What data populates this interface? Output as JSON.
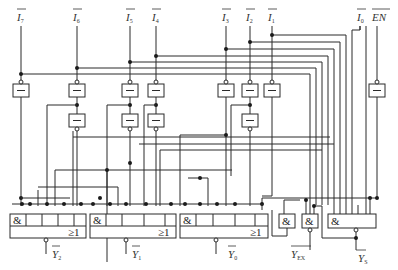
{
  "diagram": {
    "type": "logic-circuit",
    "inputs": [
      {
        "name": "I",
        "sub": "7",
        "x": 21
      },
      {
        "name": "I",
        "sub": "6",
        "x": 77
      },
      {
        "name": "I",
        "sub": "5",
        "x": 130
      },
      {
        "name": "I",
        "sub": "4",
        "x": 156
      },
      {
        "name": "I",
        "sub": "3",
        "x": 226
      },
      {
        "name": "I",
        "sub": "2",
        "x": 250
      },
      {
        "name": "I",
        "sub": "1",
        "x": 272
      },
      {
        "name": "I",
        "sub": "0",
        "x": 360
      },
      {
        "name": "EN",
        "sub": "",
        "x": 378
      }
    ],
    "outputs": [
      {
        "name": "Y",
        "sub": "2",
        "x": 46
      },
      {
        "name": "Y",
        "sub": "1",
        "x": 126
      },
      {
        "name": "Y",
        "sub": "0",
        "x": 216
      },
      {
        "name": "Y",
        "sub": "EX",
        "x": 292
      },
      {
        "name": "Y",
        "sub": "S",
        "x": 356
      }
    ],
    "gate_symbols": {
      "and": "&",
      "or": "≥1",
      "buffer": "—"
    },
    "gates": [
      {
        "id": "aoi-y2",
        "label_and": "&",
        "label_or": "≥1",
        "output": "Y2"
      },
      {
        "id": "aoi-y1",
        "label_and": "&",
        "label_or": "≥1",
        "output": "Y1"
      },
      {
        "id": "aoi-y0",
        "label_and": "&",
        "label_or": "≥1",
        "output": "Y0"
      },
      {
        "id": "and-yex",
        "label": "&",
        "output": "YEX"
      },
      {
        "id": "and-ys-ex",
        "label": "&"
      },
      {
        "id": "and-ys",
        "label": "&",
        "output": "YS"
      }
    ],
    "colors": {
      "line": "#2a2a2a",
      "background": "#ffffff"
    }
  }
}
